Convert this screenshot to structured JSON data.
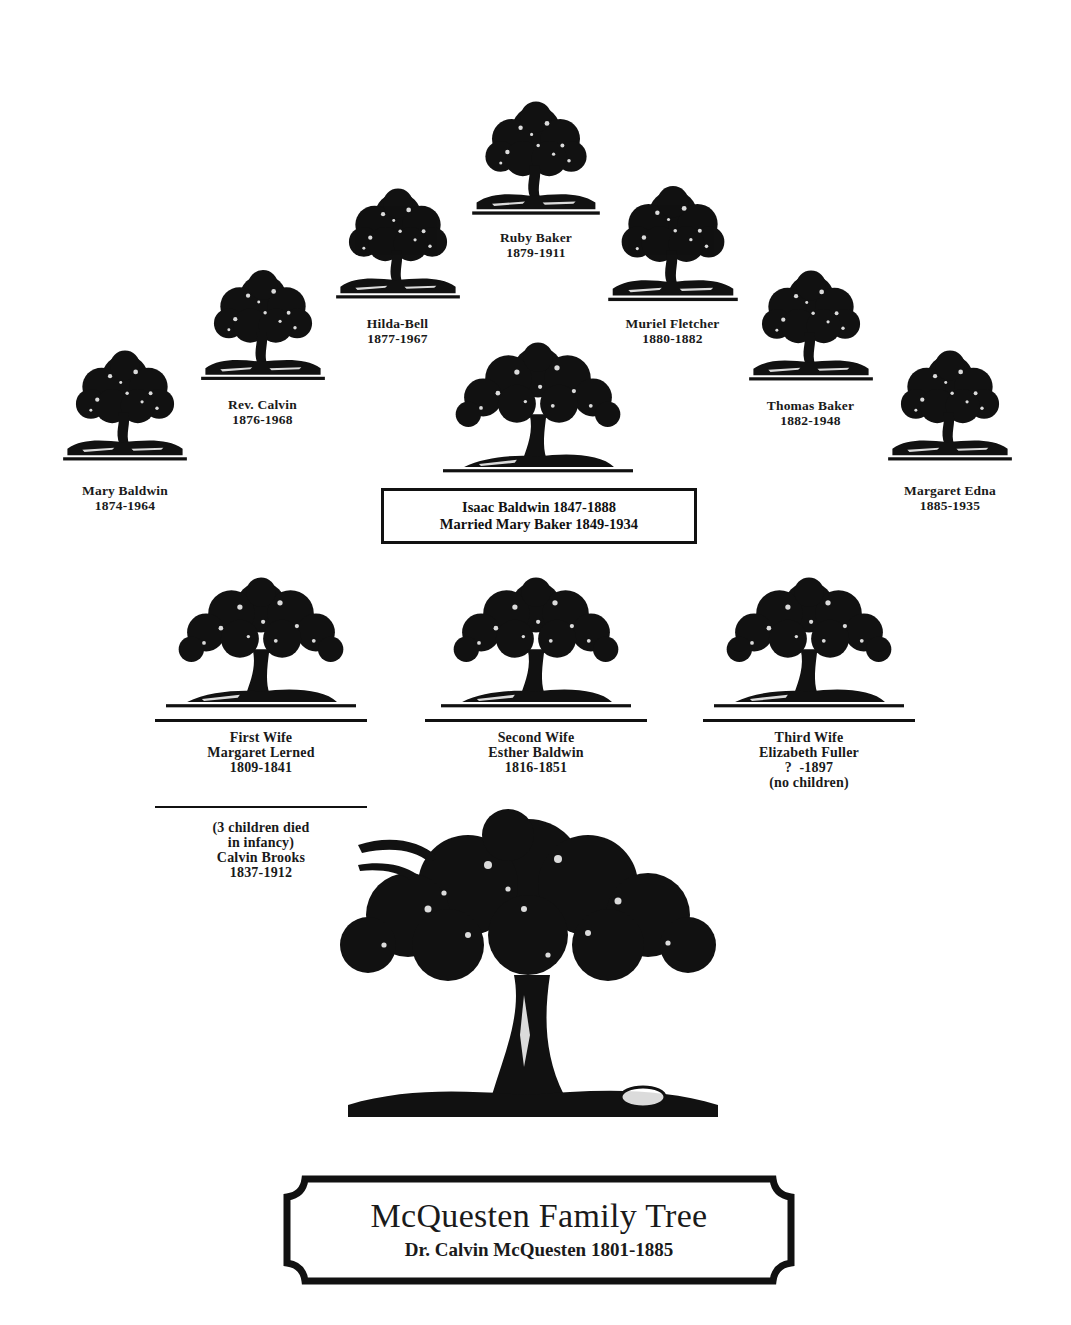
{
  "title": {
    "main": "McQuesten Family Tree",
    "subtitle": "Dr. Calvin McQuesten 1801-1885"
  },
  "patriarch": {
    "name": "Dr. Calvin McQuesten",
    "dates": "1801-1885"
  },
  "wives": [
    {
      "label": "First Wife",
      "name": "Margaret Lerned",
      "dates": "1809-1841",
      "note_lines": [
        "(3 children died",
        "in infancy)",
        "Calvin Brooks",
        "1837-1912"
      ]
    },
    {
      "label": "Second Wife",
      "name": "Esther Baldwin",
      "dates": "1816-1851"
    },
    {
      "label": "Third Wife",
      "name": "Elizabeth Fuller",
      "dates": "?  -1897",
      "note": "(no children)"
    }
  ],
  "couple": {
    "line1": "Isaac Baldwin 1847-1888",
    "line2": "Married Mary Baker 1849-1934"
  },
  "children": [
    {
      "name": "Mary Baldwin",
      "dates": "1874-1964"
    },
    {
      "name": "Rev. Calvin",
      "dates": "1876-1968"
    },
    {
      "name": "Hilda-Bell",
      "dates": "1877-1967"
    },
    {
      "name": "Ruby Baker",
      "dates": "1879-1911"
    },
    {
      "name": "Muriel Fletcher",
      "dates": "1880-1882"
    },
    {
      "name": "Thomas Baker",
      "dates": "1882-1948"
    },
    {
      "name": "Margaret Edna",
      "dates": "1885-1935"
    }
  ],
  "colors": {
    "ink": "#111111",
    "paper": "#ffffff"
  }
}
